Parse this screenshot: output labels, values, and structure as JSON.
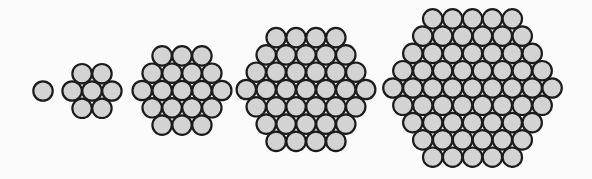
{
  "diagram": {
    "style": {
      "background": "#fbfbfb",
      "circle_fill": "#d3d3d3",
      "circle_stroke": "#1c1c1c",
      "stroke_width": 2.2,
      "circle_diameter": 19.4,
      "horizontal_pitch": 19.9,
      "row_pitch": 17.3
    },
    "hexagons": [
      {
        "id": "hex-1",
        "side": 1,
        "rows": [
          1
        ],
        "count": 1,
        "center_x": 43,
        "center_y": 91
      },
      {
        "id": "hex-2",
        "side": 2,
        "rows": [
          2,
          3,
          2
        ],
        "count": 7,
        "center_x": 92,
        "center_y": 91
      },
      {
        "id": "hex-3",
        "side": 3,
        "rows": [
          3,
          4,
          5,
          4,
          3
        ],
        "count": 19,
        "center_x": 182,
        "center_y": 90.5
      },
      {
        "id": "hex-4",
        "side": 4,
        "rows": [
          4,
          5,
          6,
          7,
          6,
          5,
          4
        ],
        "count": 37,
        "center_x": 306,
        "center_y": 89.5
      },
      {
        "id": "hex-5",
        "side": 5,
        "rows": [
          5,
          6,
          7,
          8,
          9,
          8,
          7,
          6,
          5
        ],
        "count": 61,
        "center_x": 472.5,
        "center_y": 88
      }
    ]
  }
}
